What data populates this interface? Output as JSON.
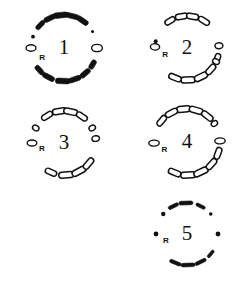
{
  "figure": {
    "background_color": "#ffffff",
    "ink_color": "#111111",
    "width": 250,
    "height": 282
  },
  "panels": [
    {
      "id": "panel-1",
      "label": "1",
      "reference_marker": "R",
      "style": "mixed-solid",
      "position": {
        "x": 0,
        "y": 0
      },
      "center": {
        "cx": 64,
        "cy": 48
      },
      "radius": 33,
      "marker_angle_deg": 205,
      "segments": [
        {
          "type": "bar-solid",
          "angle": 268,
          "length": 15,
          "thickness": 5.5
        },
        {
          "type": "bar-solid",
          "angle": 289,
          "length": 13,
          "thickness": 5.0
        },
        {
          "type": "bar-solid",
          "angle": 310,
          "length": 12,
          "thickness": 5.0
        },
        {
          "type": "bar-solid",
          "angle": 330,
          "length": 10,
          "thickness": 5.0
        },
        {
          "type": "bar-solid",
          "angle": 242,
          "length": 13,
          "thickness": 5.0
        },
        {
          "type": "bar-solid",
          "angle": 222,
          "length": 11,
          "thickness": 5.0
        },
        {
          "type": "ring-open",
          "angle": 180,
          "rx": 3.2,
          "ry": 5.0
        },
        {
          "type": "ring-open",
          "angle": 0,
          "rx": 3.6,
          "ry": 5.4
        },
        {
          "type": "bar-solid",
          "angle": 96,
          "length": 15,
          "thickness": 5.5
        },
        {
          "type": "bar-solid",
          "angle": 76,
          "length": 14,
          "thickness": 5.0
        },
        {
          "type": "bar-solid",
          "angle": 56,
          "length": 13,
          "thickness": 5.0
        },
        {
          "type": "bar-solid",
          "angle": 116,
          "length": 12,
          "thickness": 5.0
        },
        {
          "type": "bar-solid",
          "angle": 136,
          "length": 11,
          "thickness": 4.6
        },
        {
          "type": "dot-solid",
          "angle": 160,
          "r": 1.9
        },
        {
          "type": "dot-solid",
          "angle": 30,
          "r": 1.5
        }
      ]
    },
    {
      "id": "panel-2",
      "label": "2",
      "reference_marker": "R",
      "style": "outlined",
      "position": {
        "x": 125,
        "y": 0
      },
      "center": {
        "cx": 62,
        "cy": 48
      },
      "radius": 32,
      "marker_angle_deg": 198,
      "segments": [
        {
          "type": "bar-open",
          "angle": 272,
          "length": 14,
          "thickness": 6.0
        },
        {
          "type": "bar-open",
          "angle": 296,
          "length": 14,
          "thickness": 6.0
        },
        {
          "type": "bar-open",
          "angle": 318,
          "length": 12,
          "thickness": 5.6
        },
        {
          "type": "bar-open",
          "angle": 340,
          "length": 11,
          "thickness": 5.4
        },
        {
          "type": "bar-open",
          "angle": 248,
          "length": 13,
          "thickness": 5.6
        },
        {
          "type": "ring-open",
          "angle": 4,
          "rx": 3.0,
          "ry": 4.0
        },
        {
          "type": "ring-open",
          "angle": 178,
          "rx": 3.2,
          "ry": 4.6
        },
        {
          "type": "ring-open",
          "angle": 335,
          "rx": 2.6,
          "ry": 3.6
        },
        {
          "type": "bar-open",
          "angle": 100,
          "length": 12,
          "thickness": 5.6
        },
        {
          "type": "bar-open",
          "angle": 80,
          "length": 12,
          "thickness": 5.6
        },
        {
          "type": "bar-open",
          "angle": 58,
          "length": 12,
          "thickness": 5.4
        },
        {
          "type": "bar-open",
          "angle": 122,
          "length": 11,
          "thickness": 5.2
        },
        {
          "type": "dot-solid",
          "angle": 168,
          "r": 2.0
        }
      ]
    },
    {
      "id": "panel-3",
      "label": "3",
      "reference_marker": "R",
      "style": "outlined",
      "position": {
        "x": 0,
        "y": 94
      },
      "center": {
        "cx": 64,
        "cy": 49
      },
      "radius": 32,
      "marker_angle_deg": 196,
      "segments": [
        {
          "type": "bar-open",
          "angle": 274,
          "length": 15,
          "thickness": 6.0
        },
        {
          "type": "bar-open",
          "angle": 298,
          "length": 15,
          "thickness": 6.0
        },
        {
          "type": "bar-open",
          "angle": 320,
          "length": 13,
          "thickness": 5.6
        },
        {
          "type": "bar-open",
          "angle": 246,
          "length": 12,
          "thickness": 5.4
        },
        {
          "type": "ring-open",
          "angle": 8,
          "rx": 2.8,
          "ry": 3.8
        },
        {
          "type": "ring-open",
          "angle": 180,
          "rx": 3.0,
          "ry": 4.8
        },
        {
          "type": "ring-open",
          "angle": 152,
          "rx": 2.6,
          "ry": 3.4
        },
        {
          "type": "ring-open",
          "angle": 28,
          "rx": 2.6,
          "ry": 3.4
        },
        {
          "type": "bar-open",
          "angle": 98,
          "length": 14,
          "thickness": 5.8
        },
        {
          "type": "bar-open",
          "angle": 78,
          "length": 14,
          "thickness": 5.8
        },
        {
          "type": "bar-open",
          "angle": 56,
          "length": 12,
          "thickness": 5.4
        },
        {
          "type": "bar-open",
          "angle": 122,
          "length": 12,
          "thickness": 5.4
        }
      ]
    },
    {
      "id": "panel-4",
      "label": "4",
      "reference_marker": "R",
      "style": "outlined",
      "position": {
        "x": 125,
        "y": 94
      },
      "center": {
        "cx": 62,
        "cy": 48
      },
      "radius": 33,
      "marker_angle_deg": 200,
      "segments": [
        {
          "type": "bar-open",
          "angle": 272,
          "length": 15,
          "thickness": 6.0
        },
        {
          "type": "bar-open",
          "angle": 295,
          "length": 15,
          "thickness": 6.0
        },
        {
          "type": "bar-open",
          "angle": 318,
          "length": 13,
          "thickness": 5.6
        },
        {
          "type": "bar-open",
          "angle": 340,
          "length": 12,
          "thickness": 5.6
        },
        {
          "type": "bar-open",
          "angle": 248,
          "length": 13,
          "thickness": 5.6
        },
        {
          "type": "ring-open",
          "angle": 182,
          "rx": 3.0,
          "ry": 5.2
        },
        {
          "type": "ring-open",
          "angle": 2,
          "rx": 3.0,
          "ry": 5.2
        },
        {
          "type": "bar-open",
          "angle": 96,
          "length": 14,
          "thickness": 6.0
        },
        {
          "type": "bar-open",
          "angle": 74,
          "length": 14,
          "thickness": 5.8
        },
        {
          "type": "bar-open",
          "angle": 52,
          "length": 13,
          "thickness": 5.6
        },
        {
          "type": "bar-open",
          "angle": 118,
          "length": 13,
          "thickness": 5.6
        },
        {
          "type": "bar-open",
          "angle": 140,
          "length": 12,
          "thickness": 5.4
        },
        {
          "type": "ring-open",
          "angle": 34,
          "rx": 2.6,
          "ry": 3.4
        }
      ]
    },
    {
      "id": "panel-5",
      "label": "5",
      "reference_marker": "R",
      "style": "solid-dashed",
      "position": {
        "x": 125,
        "y": 188
      },
      "center": {
        "cx": 62,
        "cy": 46
      },
      "radius": 31,
      "marker_angle_deg": 197,
      "segments": [
        {
          "type": "bar-solid",
          "angle": 272,
          "length": 14,
          "thickness": 3.6
        },
        {
          "type": "bar-solid",
          "angle": 296,
          "length": 12,
          "thickness": 3.4
        },
        {
          "type": "bar-solid",
          "angle": 248,
          "length": 12,
          "thickness": 3.4
        },
        {
          "type": "bar-solid",
          "angle": 320,
          "length": 9,
          "thickness": 3.0
        },
        {
          "type": "dot-solid",
          "angle": 180,
          "r": 2.4
        },
        {
          "type": "dot-solid",
          "angle": 0,
          "r": 2.4
        },
        {
          "type": "bar-solid",
          "angle": 92,
          "length": 14,
          "thickness": 3.8
        },
        {
          "type": "bar-solid",
          "angle": 116,
          "length": 11,
          "thickness": 3.4
        },
        {
          "type": "bar-solid",
          "angle": 64,
          "length": 10,
          "thickness": 3.2
        },
        {
          "type": "dot-solid",
          "angle": 140,
          "r": 2.2
        },
        {
          "type": "dot-solid",
          "angle": 40,
          "r": 1.8
        }
      ]
    }
  ]
}
